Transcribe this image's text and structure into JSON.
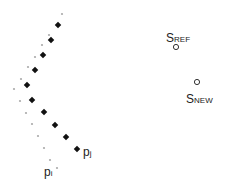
{
  "diagram": {
    "points_large": [
      [
        58,
        25
      ],
      [
        51,
        40
      ],
      [
        43,
        55
      ],
      [
        35,
        70
      ],
      [
        27,
        85
      ],
      [
        32,
        100
      ],
      [
        44,
        112
      ],
      [
        55,
        125
      ],
      [
        66,
        137
      ],
      [
        77,
        149
      ]
    ],
    "points_small": [
      [
        62,
        14
      ],
      [
        49,
        35
      ],
      [
        42,
        45
      ],
      [
        35,
        57
      ],
      [
        28,
        67
      ],
      [
        21,
        79
      ],
      [
        14,
        89
      ],
      [
        20,
        101
      ],
      [
        26,
        113
      ],
      [
        32,
        124
      ],
      [
        38,
        136
      ],
      [
        44,
        148
      ],
      [
        50,
        160
      ],
      [
        57,
        168
      ]
    ],
    "label_pj": {
      "main": "p",
      "sub": "j"
    },
    "label_pi": {
      "main": "p",
      "sub": "i"
    },
    "s_ref": {
      "main": "S",
      "sub": "REF"
    },
    "s_new": {
      "main": "S",
      "sub": "NEW"
    },
    "colors": {
      "large": "#111111",
      "small": "#aaaaaa",
      "circle": "#333333"
    }
  }
}
